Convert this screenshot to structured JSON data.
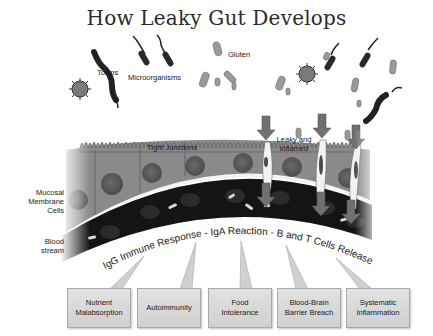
{
  "title": "How Leaky Gut Develops",
  "labels": {
    "toxins": "Toxins",
    "microorganisms": "Microorganisms",
    "gluten": "Gluten",
    "tight_junctions": "Tight Junctions",
    "leaky_inflamed": [
      "Leaky and",
      "inflamed"
    ],
    "mucosal_cells": [
      "Mucosal",
      "Membrane",
      "Cells"
    ],
    "blood_stream": [
      "Blood",
      "stream"
    ]
  },
  "immune_arc_text": "IgG Immune Response - IgA Reaction - B and T Cells Release",
  "outcomes": [
    {
      "lines": [
        "Nutrient",
        "Malabsorption"
      ]
    },
    {
      "lines": [
        "Autoimmunity"
      ]
    },
    {
      "lines": [
        "Food",
        "Intolerance"
      ]
    },
    {
      "lines": [
        "Blood-Brain",
        "Barrier Breach"
      ]
    },
    {
      "lines": [
        "Systematic",
        "Inflammation"
      ]
    }
  ],
  "colors": {
    "cell_fill": "#8a8a8a",
    "nucleus": "#5e5e5e",
    "blood": "#141414",
    "membrane_line": "#f2f2f2",
    "arrow": "#6e6e6e",
    "box_fill": "#d8d8d8"
  }
}
